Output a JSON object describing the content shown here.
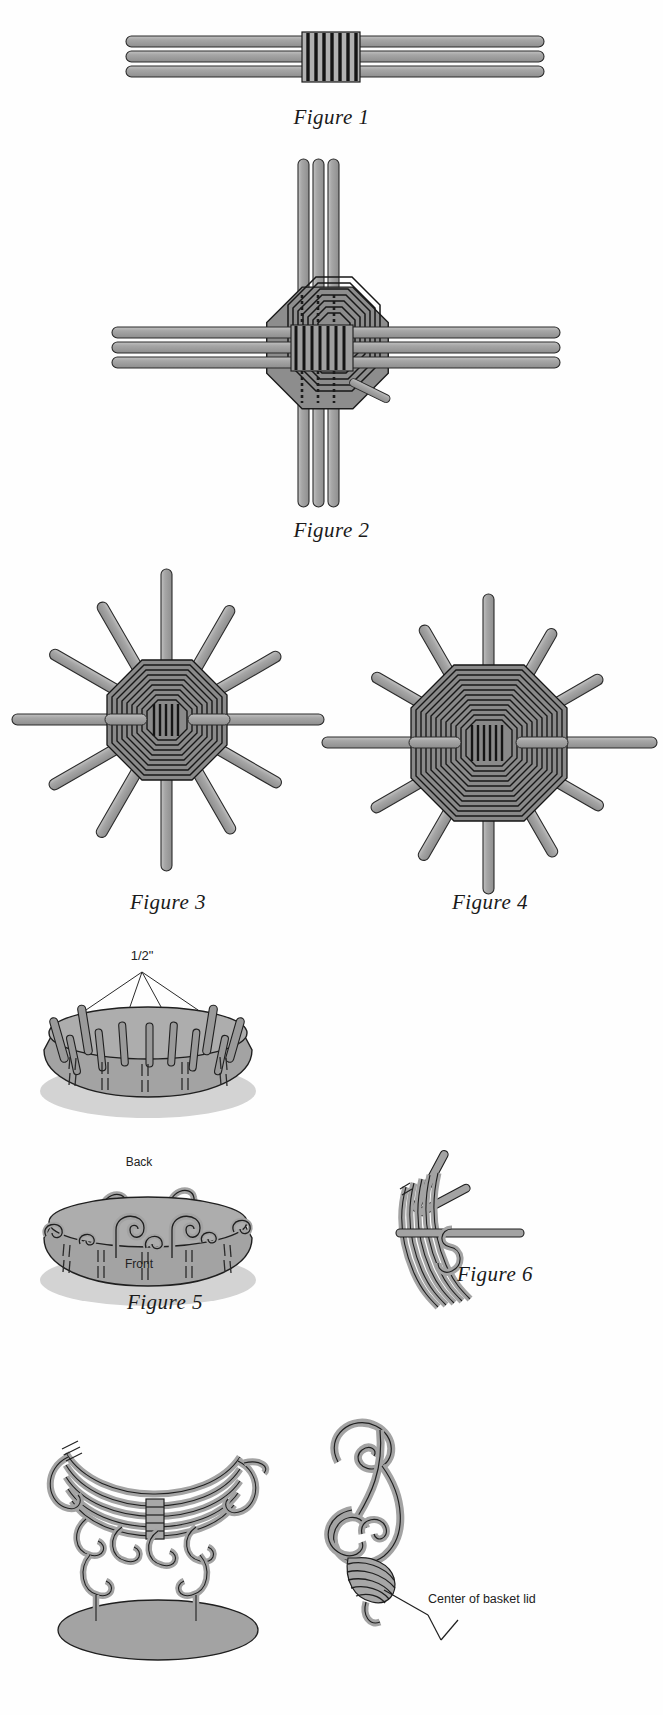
{
  "page": {
    "background_color": "#ffffff"
  },
  "colors": {
    "reed_fill": "#9b9b9b",
    "reed_fill_light": "#b4b4b4",
    "reed_stroke": "#2b2b2b",
    "weave_dark": "#1c1c1c",
    "basket_fill": "#a3a3a3",
    "shadow": "#c9c9c9",
    "text": "#1a1a1a"
  },
  "figures": [
    {
      "id": "figure-1",
      "caption": "Figure 1",
      "description": "Three parallel reeds bound at center with a wrapped band",
      "spoke_count": 3,
      "wrap_bands": 7
    },
    {
      "id": "figure-2",
      "caption": "Figure 2",
      "description": "Cross of three horizontal and three vertical reeds with octagonal woven center",
      "horizontal_reeds": 3,
      "vertical_reeds": 3,
      "weave_rings": 8
    },
    {
      "id": "figure-3",
      "caption": "Figure 3",
      "description": "Octagonal woven base with radiating spokes",
      "spoke_count": 12,
      "weave_rings": 9
    },
    {
      "id": "figure-4",
      "caption": "Figure 4",
      "description": "Expanded octagonal woven base with radiating spokes",
      "spoke_count": 12,
      "weave_rings": 12
    },
    {
      "id": "figure-5",
      "caption": "Figure 5",
      "description": "Two basket views: upright stakes trimmed to half inch, and stakes curled over",
      "measure_label": "1/2\"",
      "back_label": "Back",
      "front_label": "Front",
      "upper_stakes": 12,
      "lower_curls": 10
    },
    {
      "id": "figure-6",
      "caption": "Figure 6",
      "description": "Side view detail of reed bundle with looped weaver passing through"
    },
    {
      "id": "figure-7",
      "caption": "",
      "description": "Finished coiled basket on oval base, side elevation"
    },
    {
      "id": "figure-8",
      "caption": "",
      "description": "Scrolled lid coil detail with leader line",
      "annotation": "Center of basket lid"
    }
  ],
  "annotations": {
    "half_inch": "1/2\"",
    "back": "Back",
    "front": "Front",
    "center_of_basket_lid": "Center of basket lid"
  },
  "captions": {
    "fig1": "Figure 1",
    "fig2": "Figure 2",
    "fig3": "Figure 3",
    "fig4": "Figure 4",
    "fig5": "Figure 5",
    "fig6": "Figure 6"
  }
}
